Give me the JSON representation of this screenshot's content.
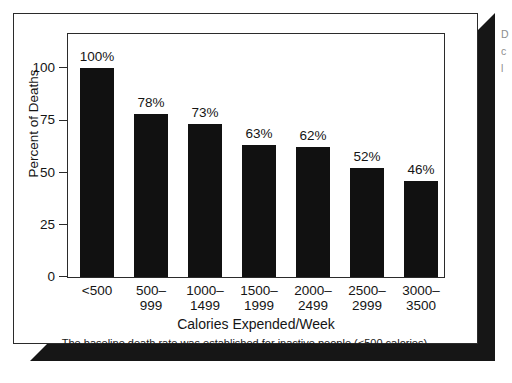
{
  "figure": {
    "caption": "The baseline death rate was established for inactive people (<500 calories).",
    "edge_text_fragments": [
      "D",
      "c",
      "l"
    ]
  },
  "chart_data": {
    "type": "bar",
    "title": "",
    "xlabel": "Calories Expended/Week",
    "ylabel": "Percent of Deaths",
    "categories": [
      "<500",
      "500–999",
      "1000–1499",
      "1500–1999",
      "2000–2499",
      "2500–2999",
      "3000–3500"
    ],
    "category_lines": [
      {
        "line1": "<500",
        "line2": ""
      },
      {
        "line1": "500–",
        "line2": "999"
      },
      {
        "line1": "1000–",
        "line2": "1499"
      },
      {
        "line1": "1500–",
        "line2": "1999"
      },
      {
        "line1": "2000–",
        "line2": "2499"
      },
      {
        "line1": "2500–",
        "line2": "2999"
      },
      {
        "line1": "3000–",
        "line2": "3500"
      }
    ],
    "values": [
      100,
      78,
      73,
      63,
      62,
      52,
      46
    ],
    "value_labels": [
      "100%",
      "78%",
      "73%",
      "63%",
      "62%",
      "52%",
      "46%"
    ],
    "ylim": [
      0,
      110
    ],
    "yticks": [
      0,
      25,
      50,
      75,
      100
    ],
    "ytick_labels": [
      "0",
      "25",
      "50",
      "75",
      "100"
    ],
    "grid": false,
    "legend": false,
    "bar_color": "#111111",
    "background_color": "#ffffff"
  }
}
